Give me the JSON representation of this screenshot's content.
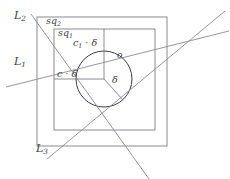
{
  "figure": {
    "kind": "geometry-diagram",
    "background_color": "#ffffff",
    "stroke_color": "#6e6e78",
    "circle_stroke_color": "#3c3c46",
    "text_color": "#3c3c46",
    "width": 230,
    "height": 179
  },
  "labels": {
    "line_1": {
      "text": "L",
      "sub": "1"
    },
    "line_2": {
      "text": "L",
      "sub": "2"
    },
    "line_3": {
      "text": "L",
      "sub": "3"
    },
    "square_outer": {
      "text": "sq",
      "sub": "2"
    },
    "square_inner": {
      "text": "sq",
      "sub": "1"
    },
    "measure_c1_delta": {
      "text": "c",
      "sub": "1",
      "suffix": " · δ"
    },
    "measure_c_delta": {
      "text": "c",
      "sub": "",
      "suffix": " · δ"
    },
    "radius_delta": {
      "text": "δ"
    },
    "center_point": {
      "text": "o"
    }
  },
  "geometry": {
    "square_outer": {
      "x": 37,
      "y": 17,
      "width": 130,
      "height": 129
    },
    "square_inner": {
      "x": 54,
      "y": 29,
      "width": 101,
      "height": 101
    },
    "circle": {
      "cx": 104,
      "cy": 79,
      "r": 28
    },
    "radii": [
      {
        "name": "radius-up",
        "to_x": 104,
        "to_y": 51
      },
      {
        "name": "radius-left",
        "to_x": 76,
        "to_y": 79
      },
      {
        "name": "radius-lower-right",
        "to_x": 123,
        "to_y": 100
      }
    ],
    "lines": [
      {
        "name": "line-L1",
        "x1": 12,
        "y1": 85,
        "x2": 228,
        "y2": 31
      },
      {
        "name": "line-L2",
        "x1": 30,
        "y1": 15,
        "x2": 148,
        "y2": 178
      },
      {
        "name": "line-L3",
        "x1": 47,
        "y1": 158,
        "x2": 222,
        "y2": 13
      }
    ],
    "label_positions": {
      "line_1": {
        "x": 14,
        "y": 57
      },
      "line_2": {
        "x": 30,
        "y": 10
      },
      "line_3": {
        "x": 38,
        "y": 144
      },
      "square_outer": {
        "x": 47,
        "y": 17
      },
      "square_inner": {
        "x": 59,
        "y": 28
      },
      "measure_c1_delta": {
        "x": 73,
        "y": 38
      },
      "measure_c_delta": {
        "x": 57,
        "y": 69
      },
      "radius_delta": {
        "x": 112,
        "y": 76
      },
      "center_point": {
        "x": 117,
        "y": 52
      }
    }
  }
}
